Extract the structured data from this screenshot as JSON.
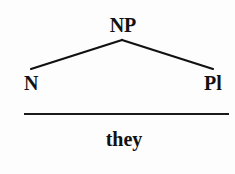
{
  "diagram": {
    "type": "syntax-tree",
    "root": {
      "label": "NP"
    },
    "children": [
      {
        "label": "N"
      },
      {
        "label": "Pl"
      }
    ],
    "rule": "horizontal-line",
    "gloss": "they"
  }
}
